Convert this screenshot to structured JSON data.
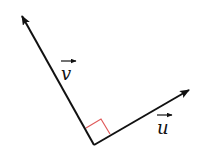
{
  "diagram": {
    "vectors": [
      {
        "name": "v",
        "label": "v",
        "from": [
          94,
          145
        ],
        "to": [
          21,
          14
        ]
      },
      {
        "name": "u",
        "label": "u",
        "from": [
          94,
          145
        ],
        "to": [
          190,
          89
        ]
      }
    ],
    "right_angle_marker_color": "#e05a5a",
    "line_color": "#111111"
  }
}
